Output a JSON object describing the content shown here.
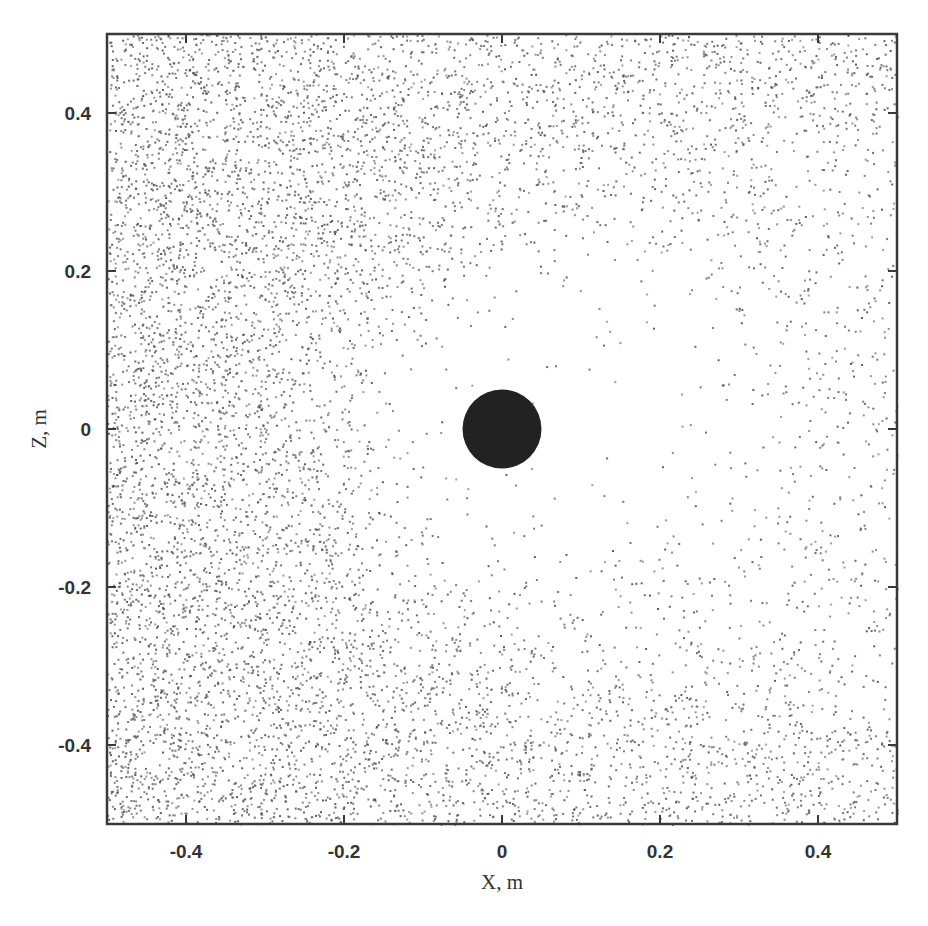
{
  "chart_data": {
    "type": "scatter",
    "title": "",
    "xlabel": "X, m",
    "ylabel": "Z, m",
    "xlim": [
      -0.5,
      0.5
    ],
    "ylim": [
      -0.5,
      0.5
    ],
    "xticks": [
      -0.4,
      -0.2,
      0,
      0.2,
      0.4
    ],
    "yticks": [
      -0.4,
      -0.2,
      0,
      0.2,
      0.4
    ],
    "xtick_labels": [
      "-0.4",
      "-0.2",
      "0",
      "0.2",
      "0.4"
    ],
    "ytick_labels": [
      "-0.4",
      "-0.2",
      "0",
      "0.2",
      "0.4"
    ],
    "grid": false,
    "legend": null,
    "obstacle": {
      "shape": "circle",
      "center": [
        0,
        0
      ],
      "radius": 0.05,
      "color": "#222222"
    },
    "particle_field": {
      "description": "Scattered particle positions in the X-Z plane; dense on the left (upstream), with a depleted, nearly empty region around and downstream (right) of the central circular obstacle",
      "approx_count": 9000,
      "point_color": "#555555",
      "point_size_px": 2,
      "dense_region": "x < -0.2",
      "depleted_region": {
        "center": [
          0.1,
          0.0
        ],
        "radius": 0.32
      },
      "edge_density_note": "moderate density along top (z>0.4) and bottom (z<-0.4) edges"
    }
  },
  "colors": {
    "frame": "#3a3a3a",
    "text": "#333333",
    "background": "#ffffff"
  }
}
